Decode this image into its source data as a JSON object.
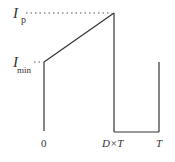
{
  "diagram": {
    "type": "current-waveform",
    "labels": {
      "ip_main": "I",
      "ip_sub": "p",
      "imin_main": "I",
      "imin_sub": "min",
      "x0": "0",
      "xdt": "D×T",
      "xt": "T"
    },
    "colors": {
      "line": "#333333",
      "dotted": "#555555"
    },
    "points": {
      "start": [
        44,
        62
      ],
      "peak": [
        114,
        13
      ],
      "drop_bottom": [
        114,
        132
      ],
      "end_bottom": [
        159,
        132
      ],
      "end_top": [
        159,
        62
      ],
      "axis_bottom": [
        44,
        131
      ]
    }
  }
}
